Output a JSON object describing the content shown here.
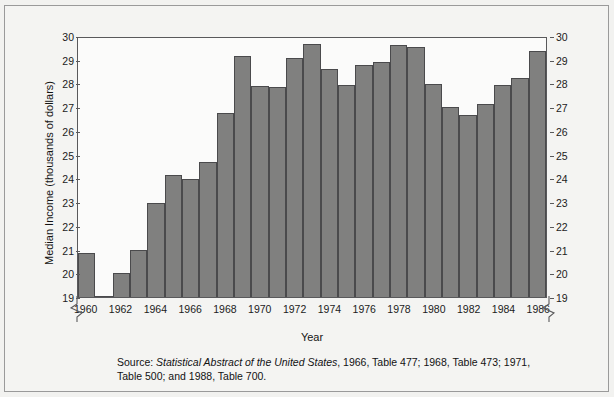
{
  "chart_data": {
    "type": "bar",
    "title": "",
    "xlabel": "Year",
    "ylabel": "Median Income (thousands of dollars)",
    "ylim": [
      19,
      30
    ],
    "yticks": [
      19,
      20,
      21,
      22,
      23,
      24,
      25,
      26,
      27,
      28,
      29,
      30
    ],
    "y_axis_break": true,
    "grid": false,
    "legend": null,
    "categories": [
      1960,
      1961,
      1962,
      1963,
      1964,
      1965,
      1966,
      1967,
      1968,
      1969,
      1970,
      1971,
      1972,
      1973,
      1974,
      1975,
      1976,
      1977,
      1978,
      1979,
      1980,
      1981,
      1982,
      1983,
      1984,
      1985,
      1986
    ],
    "xtick_labels": [
      "1960",
      "1962",
      "1964",
      "1966",
      "1968",
      "1970",
      "1972",
      "1974",
      "1976",
      "1978",
      "1980",
      "1982",
      "1984",
      "1986"
    ],
    "values": [
      20.85,
      19.0,
      20.0,
      21.0,
      23.0,
      24.2,
      24.0,
      24.75,
      26.8,
      29.25,
      27.95,
      27.9,
      29.15,
      29.75,
      28.7,
      28.0,
      28.85,
      29.0,
      29.7,
      29.6,
      28.05,
      27.05,
      26.75,
      27.2,
      28.0,
      28.3,
      29.45
    ],
    "bar_color": "#80807f",
    "bar_edge_color": "#4a4a4c",
    "plot_background": "#fbfbfa",
    "axis_color": "#59595b"
  },
  "source": {
    "prefix": "Source: ",
    "italic_title": "Statistical Abstract of the United States",
    "rest": ", 1966, Table 477; 1968, Table 473; 1971, Table 500; and 1988, Table 700."
  }
}
